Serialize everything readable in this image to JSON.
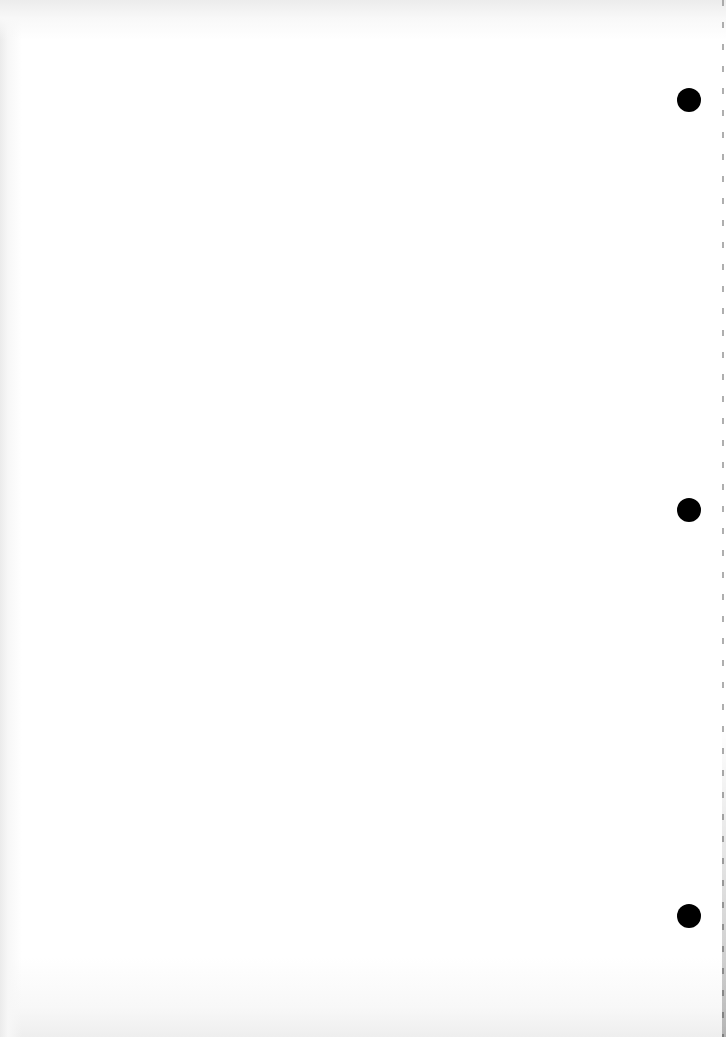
{
  "document": {
    "type": "blank-page",
    "text_content": "",
    "punch_holes": 3,
    "colors": {
      "paper": "#ffffff",
      "hole": "#000000",
      "perforation": "#9a9a9a"
    }
  }
}
